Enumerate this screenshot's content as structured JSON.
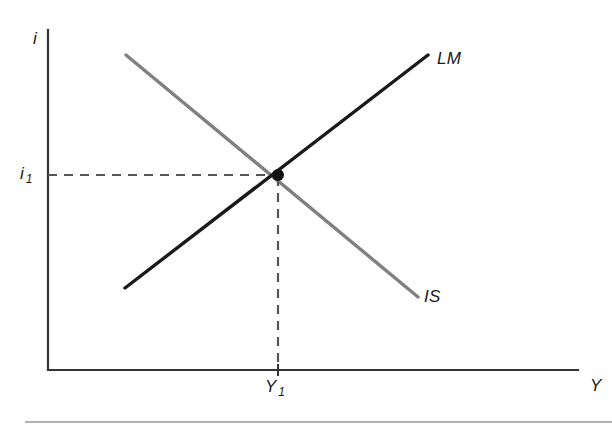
{
  "figure": {
    "kind": "is-lm-equilibrium-diagram",
    "background_color": "#ffffff",
    "footer_rule_color": "#9a9a9a"
  },
  "axes": {
    "y_axis_label": "i",
    "x_axis_label": "Y",
    "axis_color": "#333333",
    "y_axis": {
      "x": 48,
      "y_top": 30,
      "y_bottom": 370
    },
    "x_axis": {
      "y": 370,
      "x_left": 48,
      "x_right": 578
    }
  },
  "ticks": {
    "y_tick_label": "i",
    "y_tick_subscript": "1",
    "x_tick_label": "Y",
    "x_tick_subscript": "1",
    "x_tick_mark": {
      "x": 278,
      "y_top": 364,
      "y_bottom": 376
    }
  },
  "curves": [
    {
      "name": "IS",
      "label": "IS",
      "color": "#808080",
      "slope": "downward",
      "stroke_width": 3.4,
      "x1": 126,
      "y1": 55,
      "x2": 418,
      "y2": 297
    },
    {
      "name": "LM",
      "label": "LM",
      "color": "#1a1a1a",
      "slope": "upward",
      "stroke_width": 3.4,
      "x1": 125,
      "y1": 288,
      "x2": 428,
      "y2": 55
    }
  ],
  "equilibrium": {
    "point_label": "equilibrium",
    "x": 278,
    "y": 175,
    "radius": 6,
    "color": "#111111",
    "dashed_color": "#555555",
    "horizontal_guide": {
      "x1": 48,
      "y1": 175,
      "x2": 278,
      "y2": 175
    },
    "vertical_guide": {
      "x1": 278,
      "y1": 177,
      "x2": 278,
      "y2": 370
    }
  },
  "footer": {
    "rule": {
      "x1": 25,
      "y": 422,
      "x2": 612
    }
  },
  "chart_data": {
    "type": "line",
    "title": "",
    "xlabel": "Y",
    "ylabel": "i",
    "grid": false,
    "legend": "inline-curve-labels",
    "annotations": [
      "i",
      "i 1",
      "Y",
      "Y 1",
      "IS",
      "LM"
    ],
    "series": [
      {
        "name": "IS",
        "color": "#808080",
        "points": [
          [
            126,
            55
          ],
          [
            418,
            297
          ]
        ],
        "description": "downward sloping goods-market equilibrium schedule"
      },
      {
        "name": "LM",
        "color": "#1a1a1a",
        "points": [
          [
            125,
            288
          ],
          [
            428,
            55
          ]
        ],
        "description": "upward sloping money-market equilibrium schedule"
      }
    ],
    "markers": [
      {
        "label": "equilibrium",
        "x": 278,
        "y": 175
      }
    ],
    "axis_ticks": {
      "x": [
        {
          "position": 278,
          "label": "Y 1"
        }
      ],
      "y": [
        {
          "position": 175,
          "label": "i 1"
        }
      ]
    }
  }
}
